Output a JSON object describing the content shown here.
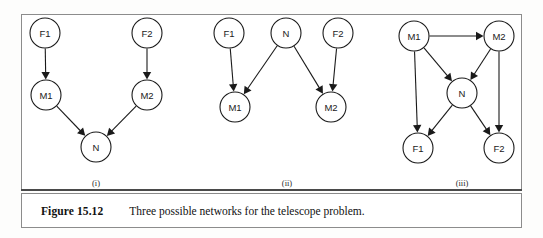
{
  "figure": {
    "caption_label": "Figure 15.12",
    "caption_text": "Three possible networks for the telescope problem."
  },
  "panels": [
    {
      "id": "panel-i",
      "label": "(i)",
      "label_x": 96,
      "label_y": 178,
      "nodes": [
        {
          "id": "F1",
          "label": "F1",
          "cx": 45,
          "cy": 33,
          "r": 15
        },
        {
          "id": "F2",
          "label": "F2",
          "cx": 147,
          "cy": 33,
          "r": 15
        },
        {
          "id": "M1",
          "label": "M1",
          "cx": 46,
          "cy": 95,
          "r": 15
        },
        {
          "id": "M2",
          "label": "M2",
          "cx": 147,
          "cy": 95,
          "r": 15
        },
        {
          "id": "N",
          "label": "N",
          "cx": 96,
          "cy": 147,
          "r": 15
        }
      ],
      "edges": [
        {
          "from": "F1",
          "to": "M1"
        },
        {
          "from": "F2",
          "to": "M2"
        },
        {
          "from": "M1",
          "to": "N"
        },
        {
          "from": "M2",
          "to": "N"
        }
      ]
    },
    {
      "id": "panel-ii",
      "label": "(ii)",
      "label_x": 287,
      "label_y": 178,
      "nodes": [
        {
          "id": "F1",
          "label": "F1",
          "cx": 229,
          "cy": 33,
          "r": 15
        },
        {
          "id": "N",
          "label": "N",
          "cx": 286,
          "cy": 33,
          "r": 15
        },
        {
          "id": "F2",
          "label": "F2",
          "cx": 338,
          "cy": 33,
          "r": 15
        },
        {
          "id": "M1",
          "label": "M1",
          "cx": 235,
          "cy": 107,
          "r": 15
        },
        {
          "id": "M2",
          "label": "M2",
          "cx": 331,
          "cy": 107,
          "r": 15
        }
      ],
      "edges": [
        {
          "from": "F1",
          "to": "M1"
        },
        {
          "from": "N",
          "to": "M1"
        },
        {
          "from": "N",
          "to": "M2"
        },
        {
          "from": "F2",
          "to": "M2"
        }
      ]
    },
    {
      "id": "panel-iii",
      "label": "(iii)",
      "label_x": 462,
      "label_y": 178,
      "nodes": [
        {
          "id": "M1",
          "label": "M1",
          "cx": 414,
          "cy": 36,
          "r": 15
        },
        {
          "id": "M2",
          "label": "M2",
          "cx": 499,
          "cy": 36,
          "r": 15
        },
        {
          "id": "N",
          "label": "N",
          "cx": 462,
          "cy": 93,
          "r": 15
        },
        {
          "id": "F1",
          "label": "F1",
          "cx": 418,
          "cy": 148,
          "r": 15
        },
        {
          "id": "F2",
          "label": "F2",
          "cx": 499,
          "cy": 148,
          "r": 15
        }
      ],
      "edges": [
        {
          "from": "M1",
          "to": "M2"
        },
        {
          "from": "M1",
          "to": "N"
        },
        {
          "from": "M2",
          "to": "N"
        },
        {
          "from": "M1",
          "to": "F1"
        },
        {
          "from": "M2",
          "to": "F2"
        },
        {
          "from": "N",
          "to": "F1"
        },
        {
          "from": "N",
          "to": "F2"
        }
      ]
    }
  ]
}
